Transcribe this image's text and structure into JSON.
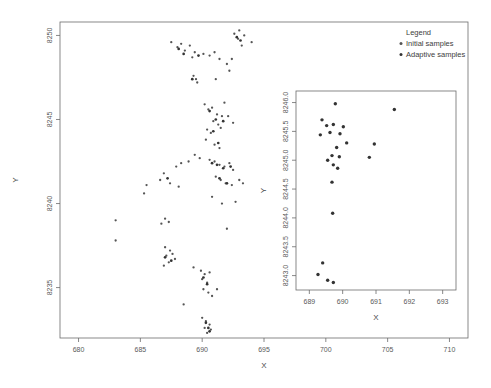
{
  "figure": {
    "background_color": "#ffffff",
    "axis_color": "#6b6b6b",
    "point_color_initial": "#555555",
    "point_color_adaptive": "#333333"
  },
  "legend": {
    "title": "Legend",
    "entries": [
      {
        "label": "Initial samples",
        "marker": "dot",
        "color": "#555555"
      },
      {
        "label": "Adaptive samples",
        "marker": "dot",
        "color": "#333333"
      }
    ]
  },
  "chart_data": [
    {
      "type": "scatter",
      "name": "main-panel",
      "title": "",
      "xlabel": "X",
      "ylabel": "Y",
      "xlim": [
        678.5,
        711.5
      ],
      "ylim": [
        8232.0,
        8250.8
      ],
      "xticks": [
        680,
        685,
        690,
        695,
        700,
        705,
        710
      ],
      "yticks": [
        8235,
        8240,
        8245,
        8250
      ],
      "grid": false,
      "legend_position": "top-right-outside",
      "series": [
        {
          "name": "Initial samples",
          "color": "#555555",
          "points": [
            [
              683.0,
              8239.0
            ],
            [
              687.5,
              8249.6
            ],
            [
              688.0,
              8249.3
            ],
            [
              688.3,
              8249.5
            ],
            [
              688.6,
              8249.1
            ],
            [
              689.0,
              8249.4
            ],
            [
              689.4,
              8249.0
            ],
            [
              689.2,
              8248.7
            ],
            [
              690.1,
              8248.9
            ],
            [
              690.6,
              8248.8
            ],
            [
              691.0,
              8249.0
            ],
            [
              691.4,
              8248.6
            ],
            [
              692.0,
              8248.3
            ],
            [
              692.6,
              8250.1
            ],
            [
              692.9,
              8249.8
            ],
            [
              693.0,
              8250.3
            ],
            [
              693.4,
              8250.0
            ],
            [
              693.2,
              8249.4
            ],
            [
              694.0,
              8249.6
            ],
            [
              692.4,
              8248.6
            ],
            [
              692.2,
              8247.9
            ],
            [
              689.3,
              8247.6
            ],
            [
              689.5,
              8247.4
            ],
            [
              689.6,
              8247.2
            ],
            [
              691.1,
              8247.4
            ],
            [
              691.8,
              8246.0
            ],
            [
              690.2,
              8245.9
            ],
            [
              690.5,
              8245.6
            ],
            [
              690.8,
              8245.7
            ],
            [
              691.2,
              8245.3
            ],
            [
              691.6,
              8245.2
            ],
            [
              690.9,
              8244.9
            ],
            [
              691.3,
              8244.7
            ],
            [
              691.5,
              8244.5
            ],
            [
              692.1,
              8245.2
            ],
            [
              692.5,
              8244.8
            ],
            [
              690.4,
              8244.4
            ],
            [
              690.7,
              8244.2
            ],
            [
              690.3,
              8243.8
            ],
            [
              691.0,
              8243.5
            ],
            [
              691.4,
              8243.3
            ],
            [
              689.4,
              8242.9
            ],
            [
              689.8,
              8242.7
            ],
            [
              688.9,
              8242.5
            ],
            [
              688.3,
              8242.4
            ],
            [
              687.9,
              8242.2
            ],
            [
              690.6,
              8242.6
            ],
            [
              691.0,
              8242.5
            ],
            [
              691.4,
              8242.3
            ],
            [
              691.8,
              8242.2
            ],
            [
              692.2,
              8242.4
            ],
            [
              692.5,
              8242.0
            ],
            [
              691.1,
              8241.6
            ],
            [
              691.5,
              8241.4
            ],
            [
              691.9,
              8241.2
            ],
            [
              692.4,
              8241.1
            ],
            [
              693.0,
              8241.4
            ],
            [
              693.3,
              8241.2
            ],
            [
              686.9,
              8241.8
            ],
            [
              686.6,
              8241.4
            ],
            [
              687.4,
              8241.2
            ],
            [
              688.1,
              8241.0
            ],
            [
              685.5,
              8241.1
            ],
            [
              685.3,
              8240.6
            ],
            [
              690.8,
              8240.4
            ],
            [
              691.6,
              8240.0
            ],
            [
              692.7,
              8240.1
            ],
            [
              687.0,
              8239.1
            ],
            [
              687.3,
              8238.9
            ],
            [
              686.7,
              8238.8
            ],
            [
              692.0,
              8238.5
            ],
            [
              683.0,
              8237.8
            ],
            [
              687.0,
              8237.4
            ],
            [
              687.4,
              8237.2
            ],
            [
              687.1,
              8236.9
            ],
            [
              687.6,
              8237.0
            ],
            [
              687.8,
              8236.7
            ],
            [
              687.3,
              8236.5
            ],
            [
              686.9,
              8236.3
            ],
            [
              689.3,
              8236.2
            ],
            [
              689.9,
              8236.0
            ],
            [
              690.2,
              8235.8
            ],
            [
              690.6,
              8235.9
            ],
            [
              690.0,
              8235.5
            ],
            [
              690.4,
              8235.3
            ],
            [
              690.1,
              8234.9
            ],
            [
              690.5,
              8234.7
            ],
            [
              690.8,
              8234.5
            ],
            [
              691.2,
              8234.9
            ],
            [
              688.5,
              8234.0
            ],
            [
              690.0,
              8233.2
            ],
            [
              690.3,
              8233.0
            ],
            [
              690.6,
              8232.8
            ],
            [
              690.2,
              8232.6
            ],
            [
              690.7,
              8232.5
            ],
            [
              690.4,
              8232.3
            ]
          ]
        },
        {
          "name": "Adaptive samples",
          "color": "#333333",
          "points": [
            [
              688.1,
              8249.2
            ],
            [
              688.5,
              8248.9
            ],
            [
              689.7,
              8248.8
            ],
            [
              692.8,
              8249.9
            ],
            [
              693.1,
              8249.7
            ],
            [
              689.2,
              8247.4
            ],
            [
              690.6,
              8245.5
            ],
            [
              691.1,
              8245.0
            ],
            [
              691.7,
              8244.9
            ],
            [
              690.9,
              8244.3
            ],
            [
              691.3,
              8243.6
            ],
            [
              690.8,
              8242.4
            ],
            [
              691.2,
              8242.3
            ],
            [
              691.7,
              8242.1
            ],
            [
              692.3,
              8242.2
            ],
            [
              691.4,
              8241.5
            ],
            [
              692.0,
              8241.2
            ],
            [
              687.2,
              8241.5
            ],
            [
              687.0,
              8236.8
            ],
            [
              687.5,
              8236.6
            ],
            [
              690.1,
              8235.6
            ],
            [
              690.4,
              8235.2
            ],
            [
              690.3,
              8232.9
            ],
            [
              690.5,
              8232.6
            ],
            [
              690.6,
              8232.4
            ]
          ]
        }
      ]
    },
    {
      "type": "scatter",
      "name": "inset-panel",
      "title": "",
      "xlabel": "X",
      "ylabel": "Y",
      "xlim": [
        688.6,
        693.4
      ],
      "ylim": [
        8242.75,
        8246.2
      ],
      "xticks": [
        689,
        690,
        691,
        692,
        693
      ],
      "yticks": [
        8243.0,
        8243.5,
        8244.0,
        8244.5,
        8245.0,
        8245.5,
        8246.0
      ],
      "grid": false,
      "series": [
        {
          "name": "Adaptive samples",
          "color": "#333333",
          "points": [
            [
              689.78,
              8245.98
            ],
            [
              691.55,
              8245.88
            ],
            [
              689.38,
              8245.7
            ],
            [
              689.52,
              8245.6
            ],
            [
              689.72,
              8245.62
            ],
            [
              690.02,
              8245.58
            ],
            [
              689.33,
              8245.44
            ],
            [
              689.62,
              8245.48
            ],
            [
              689.92,
              8245.46
            ],
            [
              690.12,
              8245.3
            ],
            [
              689.82,
              8245.22
            ],
            [
              690.95,
              8245.28
            ],
            [
              689.68,
              8245.08
            ],
            [
              689.9,
              8245.06
            ],
            [
              690.8,
              8245.05
            ],
            [
              689.55,
              8245.0
            ],
            [
              689.72,
              8244.92
            ],
            [
              689.85,
              8244.86
            ],
            [
              689.68,
              8244.62
            ],
            [
              689.7,
              8244.08
            ],
            [
              689.4,
              8243.22
            ],
            [
              689.26,
              8243.02
            ],
            [
              689.55,
              8242.92
            ],
            [
              689.72,
              8242.88
            ]
          ]
        }
      ]
    }
  ]
}
